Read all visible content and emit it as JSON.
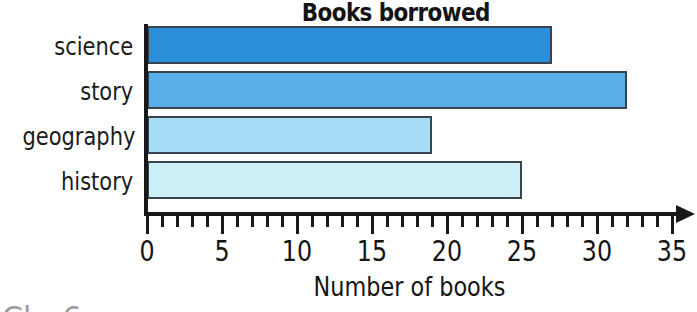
{
  "chart_data": {
    "type": "bar",
    "orientation": "horizontal",
    "title": "Books borrowed",
    "xlabel": "Number of books",
    "ylabel": "",
    "categories": [
      "science",
      "story",
      "geography",
      "history"
    ],
    "values": [
      27,
      32,
      19,
      25
    ],
    "series": [
      {
        "name": "Books borrowed",
        "values": [
          27,
          32,
          19,
          25
        ]
      }
    ],
    "bar_colors": [
      "#2a8fd8",
      "#5aaee8",
      "#a6dcf5",
      "#cdf0f8"
    ],
    "bar_border_color": "#39434d",
    "xlim": [
      0,
      35
    ],
    "xticks": [
      0,
      5,
      10,
      15,
      20,
      25,
      30,
      35
    ],
    "xtick_labels": [
      "0",
      "5",
      "10",
      "15",
      "20",
      "25",
      "30",
      "35"
    ],
    "minor_tick_step": 1,
    "grid": false,
    "legend": false,
    "axis_arrow": true,
    "axis_color": "#17181a"
  },
  "page": {
    "bleed_text": "Cl-- 6"
  }
}
